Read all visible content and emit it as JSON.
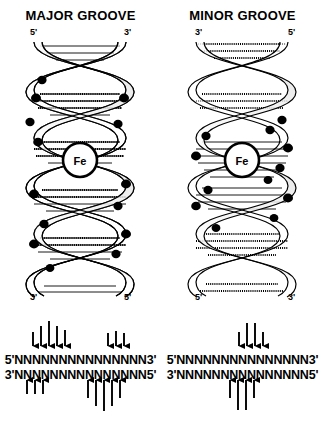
{
  "figure": {
    "type": "dna-groove-cleavage-diagram",
    "panel_count": 2,
    "ink_color": "#000000",
    "background": "#ffffff"
  },
  "panels": [
    {
      "id": "major-groove",
      "title": "MAJOR GROOVE",
      "helix": {
        "label_top_left": "5'",
        "label_top_right": "3'",
        "label_bottom_left": "3'",
        "label_bottom_right": "5'",
        "center_label": "Fe",
        "rung_style": "solid-lines",
        "groove_marked": "major",
        "cleavage_dot_count": 14
      },
      "sequence": {
        "top_prefix": "5'",
        "top_bases": "NNNNNNNNNNNNNNN",
        "top_suffix": "3'",
        "bottom_prefix": "3'",
        "bottom_bases": "NNNNNNNNNNNNNNN",
        "bottom_suffix": "5'",
        "top_arrow_count": 8,
        "bottom_arrow_count": 8,
        "pattern": "asymmetric-offset-clusters"
      }
    },
    {
      "id": "minor-groove",
      "title": "MINOR GROOVE",
      "helix": {
        "label_top_left": "3'",
        "label_top_right": "5'",
        "label_bottom_left": "5'",
        "label_bottom_right": "3'",
        "center_label": "Fe",
        "rung_style": "hatched-lines",
        "groove_marked": "minor",
        "cleavage_dot_count": 12
      },
      "sequence": {
        "top_prefix": "5'",
        "top_bases": "NNNNNNNNNNNNNNN",
        "top_suffix": "3'",
        "bottom_prefix": "3'",
        "bottom_bases": "NNNNNNNNNNNNNNN",
        "bottom_suffix": "5'",
        "top_arrow_count": 4,
        "bottom_arrow_count": 4,
        "pattern": "symmetric-central-cluster"
      }
    }
  ]
}
